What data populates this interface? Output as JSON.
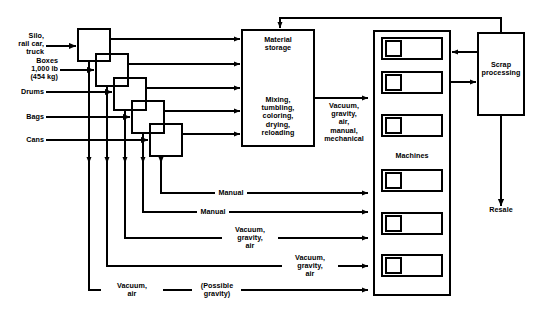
{
  "diagram": {
    "background_color": "#ffffff",
    "line_color": "#000000",
    "inputs": [
      {
        "id": "silo",
        "label": "Silo,\nrail car,\ntruck"
      },
      {
        "id": "boxes",
        "label": "Boxes\n1,000 lb\n(454 kg)"
      },
      {
        "id": "drums",
        "label": "Drums"
      },
      {
        "id": "bags",
        "label": "Bags"
      },
      {
        "id": "cans",
        "label": "Cans"
      }
    ],
    "unloader_boxes": [
      {
        "id": "unloader-1"
      },
      {
        "id": "unloader-2"
      },
      {
        "id": "unloader-3"
      },
      {
        "id": "unloader-4"
      },
      {
        "id": "unloader-5"
      }
    ],
    "storage": {
      "top_label": "Material\nstorage",
      "bottom_label": "Mixing,\ntumbling,\ncoloring,\ndrying,\nreloading"
    },
    "transfer_label_main": "Vacuum,\ngravity,\nair,\nmanual,\nmechanical",
    "conveyance_labels": [
      {
        "id": "conveyance-1",
        "label": "Manual"
      },
      {
        "id": "conveyance-2",
        "label": "Manual"
      },
      {
        "id": "conveyance-3",
        "label": "Vacuum,\ngravity,\nair"
      },
      {
        "id": "conveyance-4",
        "label": "Vacuum,\ngravity,\nair"
      },
      {
        "id": "conveyance-5",
        "label": "Vacuum,\nair"
      },
      {
        "id": "conveyance-6",
        "label": "(Possible\ngravity)"
      }
    ],
    "machines": {
      "caption": "Machines",
      "count": 6,
      "units": [
        {
          "id": "machine-1"
        },
        {
          "id": "machine-2"
        },
        {
          "id": "machine-3"
        },
        {
          "id": "machine-4"
        },
        {
          "id": "machine-5"
        },
        {
          "id": "machine-6"
        }
      ]
    },
    "scrap": {
      "label": "Scrap\nprocessing"
    },
    "output": {
      "label": "Resale"
    }
  }
}
